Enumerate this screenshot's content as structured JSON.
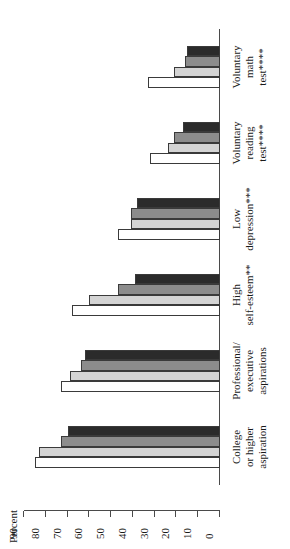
{
  "chart_data": {
    "type": "bar",
    "title": "",
    "xlabel": "",
    "ylabel": "Percent",
    "ylim": [
      0,
      90
    ],
    "grid": false,
    "legend": "none",
    "orientation": "rotated-vertical-bars",
    "categories": [
      "College or higher aspiration",
      "Professional/ executive aspirations",
      "High self-esteem**",
      "Low depression***",
      "Voluntary reading test****",
      "Voluntary math test****"
    ],
    "category_lines": [
      [
        "College",
        "or higher",
        "aspiration"
      ],
      [
        "Professional/",
        "executive",
        "aspirations"
      ],
      [
        "High",
        "self-esteem**"
      ],
      [
        "Low",
        "depression***"
      ],
      [
        "Voluntary",
        "reading",
        "test****"
      ],
      [
        "Voluntary",
        "math",
        "test****"
      ]
    ],
    "series": [
      {
        "name": "Series 1",
        "color": "#ffffff",
        "values": [
          85,
          73,
          68,
          47,
          32,
          33
        ]
      },
      {
        "name": "Series 2",
        "color": "#d4d4d4",
        "values": [
          83,
          69,
          60,
          41,
          24,
          21
        ]
      },
      {
        "name": "Series 3",
        "color": "#8c8c8c",
        "values": [
          73,
          64,
          47,
          41,
          21,
          16
        ]
      },
      {
        "name": "Series 4",
        "color": "#2b2b2b",
        "values": [
          70,
          62,
          39,
          38,
          17,
          15
        ]
      }
    ],
    "axis": {
      "ticks": [
        90,
        80,
        70,
        60,
        50,
        40,
        30,
        20,
        10,
        0
      ],
      "tick_labels": [
        "90",
        "80",
        "70",
        "60",
        "50",
        "40",
        "30",
        "20",
        "10",
        "0"
      ]
    }
  }
}
